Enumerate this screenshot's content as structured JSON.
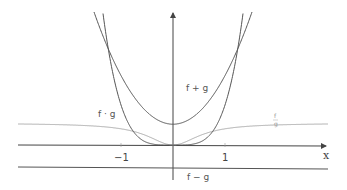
{
  "chart_data": {
    "type": "line",
    "title": "",
    "xlabel": "x",
    "ylabel": "",
    "x_ticks": [
      {
        "value": -1,
        "label": "−1"
      },
      {
        "value": 1,
        "label": "1"
      }
    ],
    "xlim": [
      -3.0,
      2.95
    ],
    "ylim": [
      -0.7,
      2.6
    ],
    "grid": false,
    "legend": "inline labels",
    "series": [
      {
        "name": "f + g",
        "label": "f + g",
        "formula": "0.935*x^2 + 0.4",
        "min_point": [
          0,
          0.4
        ],
        "color": "#555555"
      },
      {
        "name": "f · g",
        "label": "f · g",
        "formula": "0.77*x^4",
        "min_point": [
          0,
          0
        ],
        "color": "#555555"
      },
      {
        "name": "f / g",
        "label_num": "f",
        "label_den": "g",
        "formula": "0.42*x^2/(x^2+0.35)",
        "asymptote": 0.42,
        "min_point": [
          0,
          0
        ],
        "color": "#aaaaaa"
      },
      {
        "name": "f − g",
        "label": "f − g",
        "formula": "-0.42",
        "color": "#555555"
      }
    ],
    "intersections": [
      [
        -1.23,
        1.8
      ],
      [
        1.31,
        1.86
      ]
    ]
  },
  "labels": {
    "f_plus_g": "f + g",
    "f_times_g": "f · g",
    "f_div_g_num": "f",
    "f_div_g_den": "g",
    "f_minus_g": "f − g",
    "x_axis": "x",
    "tick_neg1": "−1",
    "tick_1": "1"
  },
  "colors": {
    "axis": "#444444",
    "curve_dark": "#555555",
    "curve_light": "#aaaaaa",
    "background": "#ffffff"
  }
}
